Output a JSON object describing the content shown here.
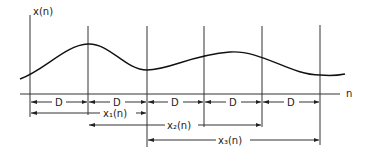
{
  "diagram": {
    "y_axis_label": "x(n)",
    "x_axis_label": "n",
    "segment_label": "D",
    "segments": [
      "D",
      "D",
      "D",
      "D",
      "D"
    ],
    "windows": [
      {
        "label": "x₁(n)",
        "name": "x1"
      },
      {
        "label": "x₂(n)",
        "name": "x2"
      },
      {
        "label": "x₃(n)",
        "name": "x3"
      }
    ]
  }
}
